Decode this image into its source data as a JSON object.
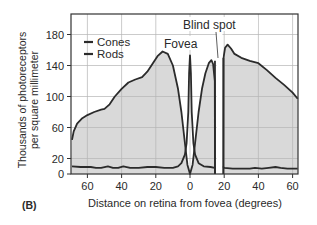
{
  "panel_label": "(B)",
  "chart_data": {
    "type": "area",
    "title": "",
    "xlabel": "Distance on retina from fovea (degrees)",
    "ylabel_line1": "Thousands of photoreceptors",
    "ylabel_line2": "per square millimeter",
    "xlim": [
      -69,
      63
    ],
    "ylim": [
      0,
      180
    ],
    "x_ticks": [
      -60,
      -40,
      -20,
      0,
      20,
      40,
      60
    ],
    "x_tick_labels": [
      "60",
      "40",
      "20",
      "0",
      "20",
      "40",
      "60"
    ],
    "y_ticks": [
      0,
      20,
      60,
      100,
      140,
      180
    ],
    "y_tick_labels": [
      "0",
      "20",
      "60",
      "100",
      "140",
      "180"
    ],
    "grid": true,
    "legend_position": "upper left",
    "annotations": [
      {
        "text": "Fovea",
        "x": 0
      },
      {
        "text": "Blind spot",
        "x": 17
      }
    ],
    "blind_spot_range": [
      15,
      19
    ],
    "series": [
      {
        "name": "Cones",
        "color": "#2b2b2b",
        "points": [
          [
            -69,
            10
          ],
          [
            -64,
            9
          ],
          [
            -58,
            9
          ],
          [
            -55,
            8
          ],
          [
            -52,
            8
          ],
          [
            -48,
            10
          ],
          [
            -45,
            8
          ],
          [
            -42,
            8
          ],
          [
            -39,
            10
          ],
          [
            -35,
            8
          ],
          [
            -30,
            8
          ],
          [
            -25,
            9
          ],
          [
            -20,
            9
          ],
          [
            -15,
            8
          ],
          [
            -10,
            8
          ],
          [
            -7,
            10
          ],
          [
            -5,
            14
          ],
          [
            -3,
            25
          ],
          [
            -2,
            40
          ],
          [
            -1,
            80
          ],
          [
            -0.5,
            130
          ],
          [
            0,
            153
          ],
          [
            0.5,
            130
          ],
          [
            1,
            80
          ],
          [
            2,
            40
          ],
          [
            3,
            25
          ],
          [
            5,
            14
          ],
          [
            8,
            10
          ],
          [
            12,
            9
          ],
          [
            14.5,
            8
          ],
          [
            15,
            8
          ]
        ],
        "points_right": [
          [
            19,
            10
          ],
          [
            20,
            8
          ],
          [
            25,
            7
          ],
          [
            30,
            7
          ],
          [
            35,
            7
          ],
          [
            38,
            8
          ],
          [
            42,
            7
          ],
          [
            46,
            8
          ],
          [
            50,
            9
          ],
          [
            53,
            8
          ],
          [
            57,
            7
          ],
          [
            63,
            7
          ]
        ]
      },
      {
        "name": "Rods",
        "color": "#2b2b2b",
        "fill": "#d9d9d9",
        "points": [
          [
            -69,
            44
          ],
          [
            -68,
            55
          ],
          [
            -66,
            65
          ],
          [
            -63,
            72
          ],
          [
            -60,
            76
          ],
          [
            -56,
            80
          ],
          [
            -52,
            83
          ],
          [
            -50,
            84
          ],
          [
            -47,
            90
          ],
          [
            -44,
            100
          ],
          [
            -40,
            110
          ],
          [
            -36,
            118
          ],
          [
            -32,
            122
          ],
          [
            -28,
            125
          ],
          [
            -25,
            132
          ],
          [
            -22,
            142
          ],
          [
            -19,
            152
          ],
          [
            -16,
            158
          ],
          [
            -13,
            155
          ],
          [
            -10,
            140
          ],
          [
            -7,
            110
          ],
          [
            -5,
            80
          ],
          [
            -3,
            40
          ],
          [
            -1.5,
            12
          ],
          [
            0,
            0
          ],
          [
            1.5,
            12
          ],
          [
            3,
            40
          ],
          [
            5,
            80
          ],
          [
            7,
            110
          ],
          [
            9,
            130
          ],
          [
            11,
            143
          ],
          [
            12.5,
            147
          ],
          [
            13.5,
            142
          ],
          [
            14.5,
            120
          ],
          [
            14.6,
            0
          ]
        ],
        "points_right": [
          [
            19.5,
            0
          ],
          [
            19.6,
            150
          ],
          [
            20.5,
            163
          ],
          [
            22,
            167
          ],
          [
            24,
            162
          ],
          [
            26,
            155
          ],
          [
            30,
            150
          ],
          [
            35,
            146
          ],
          [
            40,
            143
          ],
          [
            45,
            134
          ],
          [
            50,
            124
          ],
          [
            55,
            115
          ],
          [
            60,
            105
          ],
          [
            63,
            97
          ]
        ]
      }
    ]
  }
}
